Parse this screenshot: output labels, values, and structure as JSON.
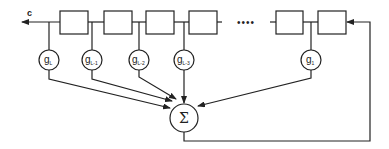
{
  "diagram": {
    "output_label": "c",
    "ellipsis": "••••",
    "sum_symbol": "Σ",
    "taps": [
      {
        "base": "g",
        "sub": "L"
      },
      {
        "base": "g",
        "sub": "L-1"
      },
      {
        "base": "g",
        "sub": "L-2"
      },
      {
        "base": "g",
        "sub": "L-3"
      },
      {
        "base": "g",
        "sub": "1"
      }
    ],
    "registers_count_visible": 6,
    "colors": {
      "stroke": "#222222",
      "background": "#ffffff"
    }
  }
}
